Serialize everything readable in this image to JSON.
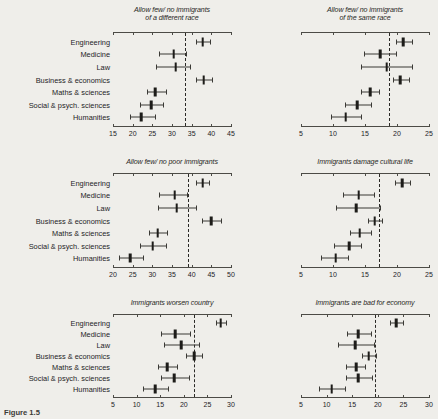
{
  "figure": {
    "caption": "Figure 1.5",
    "row_labels": [
      "Engineering",
      "Medicine",
      "Law",
      "Business & economics",
      "Maths & sciences",
      "Social & psych. sciences",
      "Humanities"
    ]
  },
  "chart_data": [
    {
      "type": "scatter",
      "panel": 1,
      "title": "Allow few/ no immigrants\nof a different race",
      "xlabel": "",
      "ylabel": "",
      "xlim": [
        15,
        45
      ],
      "ticks": [
        15,
        20,
        25,
        30,
        35,
        40,
        45
      ],
      "refline": 33.4,
      "grid": false,
      "categories": [
        "Engineering",
        "Medicine",
        "Law",
        "Business & economics",
        "Maths & sciences",
        "Social & psych. sciences",
        "Humanities"
      ],
      "values": [
        37.8,
        30.4,
        30.9,
        38.1,
        25.8,
        24.7,
        22.2
      ],
      "ci_low": [
        36.2,
        26.8,
        25.9,
        36.1,
        23.6,
        21.8,
        19.3
      ],
      "ci_high": [
        39.6,
        33.6,
        34.5,
        40.2,
        28.4,
        27.6,
        25.6
      ]
    },
    {
      "type": "scatter",
      "panel": 2,
      "title": "Allow few/ no immigrants\nof the same race",
      "xlabel": "",
      "ylabel": "",
      "xlim": [
        5,
        25
      ],
      "ticks": [
        5,
        10,
        15,
        20,
        25
      ],
      "refline": 18.8,
      "grid": false,
      "categories": [
        "Engineering",
        "Medicine",
        "Law",
        "Business & economics",
        "Maths & sciences",
        "Social & psych. sciences",
        "Humanities"
      ],
      "values": [
        21.0,
        17.4,
        18.4,
        20.5,
        15.8,
        13.8,
        12.0
      ],
      "ci_low": [
        19.8,
        14.8,
        14.4,
        19.3,
        14.4,
        11.9,
        9.7
      ],
      "ci_high": [
        22.3,
        19.9,
        22.3,
        21.9,
        17.2,
        15.9,
        14.3
      ]
    },
    {
      "type": "scatter",
      "panel": 3,
      "title": "Allow few/ no poor immigrants",
      "xlabel": "",
      "ylabel": "",
      "xlim": [
        20,
        50
      ],
      "ticks": [
        20,
        25,
        30,
        35,
        40,
        45,
        50
      ],
      "refline": 39.0,
      "grid": false,
      "categories": [
        "Engineering",
        "Medicine",
        "Law",
        "Business & economics",
        "Maths & sciences",
        "Social & psych. sciences",
        "Humanities"
      ],
      "values": [
        42.8,
        35.7,
        36.2,
        45.0,
        31.4,
        30.1,
        24.4
      ],
      "ci_low": [
        41.2,
        31.6,
        31.5,
        42.7,
        29.1,
        26.9,
        21.6
      ],
      "ci_high": [
        44.5,
        38.9,
        41.0,
        47.4,
        33.7,
        33.4,
        27.6
      ]
    },
    {
      "type": "scatter",
      "panel": 4,
      "title": "Immigrants damage cultural life",
      "xlabel": "",
      "ylabel": "",
      "xlim": [
        5,
        25
      ],
      "ticks": [
        5,
        10,
        15,
        20,
        25
      ],
      "refline": 17.2,
      "grid": false,
      "categories": [
        "Engineering",
        "Medicine",
        "Law",
        "Business & economics",
        "Maths & sciences",
        "Social & psych. sciences",
        "Humanities"
      ],
      "values": [
        20.8,
        14.0,
        13.6,
        16.5,
        14.2,
        12.5,
        10.4
      ],
      "ci_low": [
        19.7,
        11.6,
        10.5,
        15.5,
        12.7,
        10.2,
        8.2
      ],
      "ci_high": [
        22.1,
        16.4,
        17.3,
        17.6,
        15.9,
        14.4,
        12.4
      ]
    },
    {
      "type": "scatter",
      "panel": 5,
      "title": "Immigrants worsen country",
      "xlabel": "",
      "ylabel": "",
      "xlim": [
        5,
        30
      ],
      "ticks": [
        5,
        10,
        15,
        20,
        25,
        30
      ],
      "refline": 22.2,
      "grid": false,
      "categories": [
        "Engineering",
        "Medicine",
        "Law",
        "Business & economics",
        "Maths & sciences",
        "Social & psych. sciences",
        "Humanities"
      ],
      "values": [
        27.8,
        18.2,
        19.5,
        22.2,
        16.5,
        18.0,
        13.9
      ],
      "ci_low": [
        26.8,
        15.2,
        15.7,
        20.4,
        14.6,
        15.2,
        11.3
      ],
      "ci_high": [
        29.0,
        21.4,
        23.3,
        23.9,
        18.5,
        21.1,
        16.6
      ]
    },
    {
      "type": "scatter",
      "panel": 6,
      "title": "Immigrants are bad for economy",
      "xlabel": "",
      "ylabel": "",
      "xlim": [
        5,
        30
      ],
      "ticks": [
        5,
        10,
        15,
        20,
        25,
        30
      ],
      "refline": 19.4,
      "grid": false,
      "categories": [
        "Engineering",
        "Medicine",
        "Law",
        "Business & economics",
        "Maths & sciences",
        "Social & psych. sciences",
        "Humanities"
      ],
      "values": [
        23.6,
        16.2,
        15.6,
        18.2,
        15.8,
        16.2,
        11.0
      ],
      "ci_low": [
        22.4,
        13.9,
        12.2,
        17.0,
        13.8,
        13.7,
        8.6
      ],
      "ci_high": [
        25.0,
        18.6,
        19.2,
        19.6,
        17.5,
        18.8,
        13.5
      ]
    }
  ]
}
